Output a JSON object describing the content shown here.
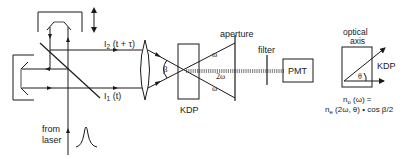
{
  "diagram": {
    "type": "optical-setup",
    "colors": {
      "line": "#1a1a1a",
      "background": "#ffffff"
    },
    "labels": {
      "beam_upper": "I",
      "beam_upper_sub": "2",
      "beam_upper_arg": " (t + τ)",
      "beam_lower": "I",
      "beam_lower_sub": "1",
      "beam_lower_arg": " (t)",
      "source_line1": "from",
      "source_line2": "laser",
      "crossing_angle": "β",
      "crystal": "KDP",
      "aperture": "aperture",
      "omega_top": "ω",
      "omega_bottom": "ω",
      "second_harmonic": "2ω",
      "filter": "filter",
      "detector": "PMT"
    },
    "inset": {
      "title_line1": "optical",
      "title_line2": "axis",
      "crystal": "KDP",
      "angle": "θ",
      "formula_line1": "nₒ (ω) =",
      "formula_line1_n": "n",
      "formula_line1_sub": "o",
      "formula_line1_rest": " (ω) =",
      "formula_line2_n": "n",
      "formula_line2_sub": "e",
      "formula_line2_rest": " (2ω, θ) • cos β/2"
    },
    "icons": [
      "double-arrow-icon",
      "pulse-shape-icon",
      "arrow-icon"
    ]
  }
}
